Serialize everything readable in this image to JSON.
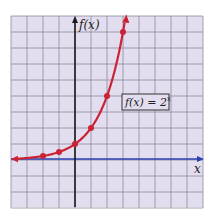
{
  "chart_data": {
    "type": "line",
    "title": "",
    "xlabel": "x",
    "ylabel": "f(x)",
    "annotation": "f(x) = 2^x",
    "annotation_parts": {
      "lhs": "f(x) = 2",
      "exp": "x"
    },
    "function": "2^x",
    "x": [
      -2,
      -1,
      0,
      1,
      2,
      3
    ],
    "values": [
      0.25,
      0.5,
      1,
      2,
      4,
      8
    ],
    "xlim": [
      -4,
      8
    ],
    "ylim": [
      -3,
      9
    ],
    "grid": true,
    "legend": "none",
    "colors": {
      "background": "#e2ddef",
      "grid": "#8d8a9c",
      "curve": "#cc2233",
      "x_axis": "#2a3fb0",
      "y_axis": "#1a1a1a",
      "box_border": "#333333",
      "box_fill": "#e2ddef"
    }
  }
}
